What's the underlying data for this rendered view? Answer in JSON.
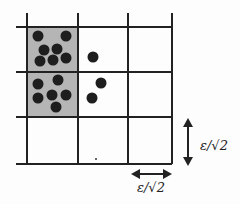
{
  "diagram": {
    "colors": {
      "grid_line": "#222222",
      "shaded_cell": "#b5b5b5",
      "dot": "#1e1e1e",
      "background": "#fdfdfd"
    },
    "grid": {
      "columns": 3,
      "rows": 3,
      "vertical_lines_x": [
        27,
        78,
        128,
        172
      ],
      "horizontal_lines_y": [
        27,
        72,
        117,
        164
      ],
      "shaded_cells": [
        {
          "row": 0,
          "col": 0
        },
        {
          "row": 1,
          "col": 0
        }
      ]
    },
    "points": {
      "cell_0_0": [
        [
          38,
          36
        ],
        [
          66,
          36
        ],
        [
          44,
          50
        ],
        [
          57,
          49
        ],
        [
          40,
          61
        ],
        [
          53,
          60
        ],
        [
          66,
          58
        ]
      ],
      "cell_1_0": [
        [
          38,
          84
        ],
        [
          58,
          80
        ],
        [
          38,
          98
        ],
        [
          52,
          95
        ],
        [
          66,
          95
        ],
        [
          56,
          107
        ]
      ],
      "cell_0_1": [
        [
          93,
          57
        ]
      ],
      "cell_1_1": [
        [
          101,
          83
        ],
        [
          92,
          98
        ]
      ]
    },
    "labels": {
      "vertical_dimension": "ε/√2",
      "horizontal_dimension": "ε/√2"
    }
  }
}
